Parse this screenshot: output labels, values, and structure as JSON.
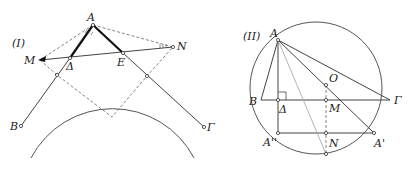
{
  "figure_1": {
    "tag": "(I)",
    "labels": {
      "A": "A",
      "M": "M",
      "N": "N",
      "Delta": "Δ",
      "E": "E",
      "B": "B",
      "Gamma": "Γ"
    },
    "angle_marks": [
      "AM",
      "AN"
    ]
  },
  "figure_2": {
    "tag": "(II)",
    "labels": {
      "A": "A",
      "B": "B",
      "Gamma": "Γ",
      "Delta": "Δ",
      "M": "M",
      "O": "O",
      "A_double_prime": "A''",
      "N": "N",
      "A_prime": "A'"
    },
    "right_angle_at": "Δ"
  }
}
